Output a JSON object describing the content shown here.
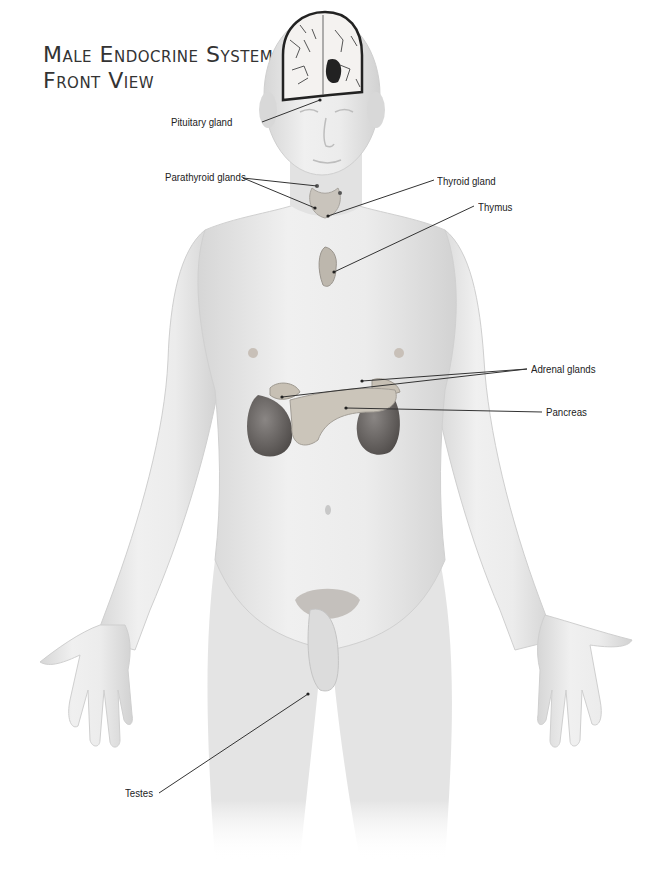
{
  "title": {
    "line1": "Male Endocrine System—",
    "line2": "Front View"
  },
  "labels": {
    "pituitary": "Pituitary gland",
    "parathyroid": "Parathyroid glands",
    "thyroid": "Thyroid gland",
    "thymus": "Thymus",
    "adrenal": "Adrenal glands",
    "pancreas": "Pancreas",
    "testes": "Testes"
  },
  "colors": {
    "skin": "#e6e6e6",
    "skin_shadow": "#c8c8c8",
    "gland": "#b8b2a8",
    "kidney": "#6e6a68",
    "leader_line": "#333333",
    "text": "#222222"
  }
}
